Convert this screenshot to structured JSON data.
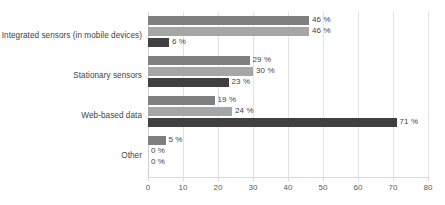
{
  "chart_data": {
    "type": "bar",
    "orientation": "horizontal",
    "title": "",
    "subtitle": "",
    "xlabel": "",
    "ylabel": "",
    "xlim": [
      0,
      80
    ],
    "xticks": [
      0,
      10,
      20,
      30,
      40,
      50,
      60,
      70,
      80
    ],
    "xtick_labels": [
      "0",
      "10",
      "20",
      "30",
      "40",
      "50",
      "60",
      "70",
      "80"
    ],
    "grid": "vertical",
    "legend": "none",
    "value_suffix": " %",
    "categories": [
      "Integrated sensors (in mobile devices)",
      "Stationary sensors",
      "Web-based data",
      "Other"
    ],
    "series": [
      {
        "name": "series-1",
        "color": "#7f7f7f",
        "values": [
          46,
          29,
          19,
          5
        ],
        "labels": [
          "46 %",
          "29 %",
          "19 %",
          "5 %"
        ]
      },
      {
        "name": "series-2",
        "color": "#a6a6a6",
        "values": [
          46,
          30,
          24,
          0
        ],
        "labels": [
          "46 %",
          "30 %",
          "24 %",
          "0 %"
        ]
      },
      {
        "name": "series-3",
        "color": "#404040",
        "values": [
          6,
          23,
          71,
          0
        ],
        "labels": [
          "6 %",
          "23 %",
          "71 %",
          "0 %"
        ]
      }
    ]
  },
  "style": {
    "background": "#ffffff",
    "gridline_color": "#e3e3e3",
    "axis_color": "#d9d9d9",
    "text_color": "#3f3f3f",
    "tick_text_color": "#595959"
  }
}
